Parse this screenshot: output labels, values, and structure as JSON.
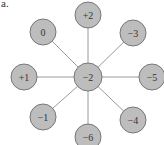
{
  "panel_label": "a.",
  "colors": {
    "node_fill": "#bdbdbd",
    "node_stroke": "#777777",
    "edge": "#9a9a9a",
    "text": "#333333"
  },
  "center": {
    "label": "−2",
    "x": 88,
    "y": 77,
    "r": 14
  },
  "nodes": [
    {
      "label": "+2",
      "x": 88,
      "y": 15,
      "r": 13
    },
    {
      "label": "−3",
      "x": 133,
      "y": 33,
      "r": 13
    },
    {
      "label": "−5",
      "x": 152,
      "y": 77,
      "r": 13
    },
    {
      "label": "−4",
      "x": 133,
      "y": 120,
      "r": 13
    },
    {
      "label": "−6",
      "x": 88,
      "y": 137,
      "r": 13
    },
    {
      "label": "−1",
      "x": 43,
      "y": 117,
      "r": 13
    },
    {
      "label": "+1",
      "x": 24,
      "y": 77,
      "r": 13
    },
    {
      "label": "0",
      "x": 43,
      "y": 32,
      "r": 13
    }
  ]
}
